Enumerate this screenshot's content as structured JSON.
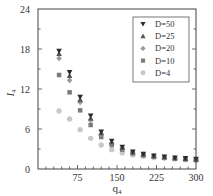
{
  "chart_data": {
    "type": "scatter",
    "title": "",
    "xlabel": "q4",
    "xlabel_main": "q",
    "xlabel_sub": "4",
    "ylabel": "I4",
    "ylabel_main": "I",
    "ylabel_sub": "4",
    "xlim": [
      0,
      300
    ],
    "ylim": [
      0,
      24
    ],
    "xticks": [
      75,
      150,
      225,
      300
    ],
    "xtick_labels": [
      "75",
      "150",
      "225",
      "300"
    ],
    "yticks": [
      0,
      6,
      12,
      18,
      24
    ],
    "ytick_labels": [
      "0",
      "6",
      "12",
      "18",
      "24"
    ],
    "grid": false,
    "legend_position": "upper right",
    "x": [
      40,
      60,
      80,
      100,
      120,
      140,
      160,
      180,
      200,
      220,
      240,
      260,
      280,
      300
    ],
    "series": [
      {
        "name": "D=50",
        "marker": "triangle-down",
        "color": "#2b2b2b",
        "values": [
          17.7,
          14.5,
          10.8,
          8.0,
          5.6,
          4.2,
          3.3,
          2.6,
          2.25,
          2.0,
          1.85,
          1.7,
          1.6,
          1.5
        ]
      },
      {
        "name": "D=25",
        "marker": "triangle-up",
        "color": "#555555",
        "values": [
          17.3,
          14.0,
          10.4,
          7.6,
          5.4,
          4.0,
          3.2,
          2.5,
          2.2,
          1.95,
          1.8,
          1.65,
          1.55,
          1.45
        ]
      },
      {
        "name": "D=20",
        "marker": "diamond",
        "color": "#9a9a9a",
        "values": [
          16.6,
          13.3,
          10.0,
          7.3,
          5.2,
          3.9,
          3.1,
          2.45,
          2.15,
          1.9,
          1.75,
          1.6,
          1.5,
          1.4
        ]
      },
      {
        "name": "D=10",
        "marker": "square",
        "color": "#7a7a7a",
        "values": [
          14.1,
          11.5,
          8.8,
          6.6,
          4.8,
          3.6,
          2.9,
          2.35,
          2.05,
          1.85,
          1.7,
          1.55,
          1.45,
          1.35
        ]
      },
      {
        "name": "D=4",
        "marker": "circle",
        "color": "#c8c8c8",
        "values": [
          8.7,
          7.5,
          5.9,
          4.6,
          3.6,
          2.9,
          2.4,
          2.1,
          1.9,
          1.7,
          1.6,
          1.5,
          1.4,
          1.3
        ]
      }
    ]
  }
}
